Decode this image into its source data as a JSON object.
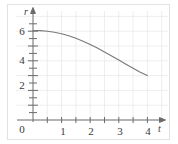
{
  "chart_data": {
    "type": "line",
    "title": "",
    "xlabel": "t",
    "ylabel": "r",
    "xlim": [
      0,
      4.45
    ],
    "ylim": [
      0,
      7.2
    ],
    "grid": true,
    "grid_step_x": 0.5,
    "grid_step_y": 1,
    "legend": "none",
    "xticks": [
      0,
      1,
      2,
      3,
      4
    ],
    "xtick_labels": [
      "0",
      "1",
      "2",
      "3",
      "4"
    ],
    "yticks": [
      2,
      4,
      6
    ],
    "ytick_labels": [
      "2",
      "4",
      "6"
    ],
    "minor_tick_step_x": 0.5,
    "minor_tick_step_y": 0.5,
    "axis_arrows": true,
    "series": [
      {
        "name": "r(t)",
        "color": "#7a7a7a",
        "x": [
          0.0,
          0.25,
          0.5,
          0.75,
          1.0,
          1.25,
          1.5,
          1.75,
          2.0,
          2.25,
          2.5,
          2.75,
          3.0,
          3.25,
          3.5,
          3.75,
          4.0
        ],
        "y": [
          6.05,
          6.04,
          6.0,
          5.93,
          5.83,
          5.69,
          5.52,
          5.32,
          5.1,
          4.86,
          4.6,
          4.33,
          4.05,
          3.77,
          3.5,
          3.23,
          3.0
        ]
      }
    ]
  },
  "axes": {
    "y_label": "r",
    "x_label": "t",
    "x_tick_0": "0",
    "x_tick_1": "1",
    "x_tick_2": "2",
    "x_tick_3": "3",
    "x_tick_4": "4",
    "y_tick_2": "2",
    "y_tick_4": "4",
    "y_tick_6": "6"
  },
  "colors": {
    "curve": "#7a7a7a",
    "grid": "#e6e6e6",
    "axis": "#6b6b6b",
    "frame": "#e2e2e2",
    "text": "#3a3a3a"
  }
}
